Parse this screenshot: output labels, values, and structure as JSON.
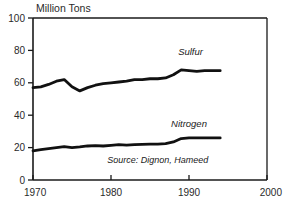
{
  "chart_data": {
    "type": "line",
    "title": "",
    "ylabel": "Million Tons",
    "xlabel": "",
    "xlim": [
      1970,
      2000
    ],
    "ylim": [
      0,
      100
    ],
    "grid": false,
    "legend_position": "inline-right-of-series",
    "x_ticks": [
      "1970",
      "1980",
      "1990",
      "2000"
    ],
    "x_tick_values": [
      1970,
      1980,
      1990,
      2000
    ],
    "y_ticks": [
      "0",
      "20",
      "40",
      "60",
      "80",
      "100"
    ],
    "y_tick_values": [
      0,
      20,
      40,
      60,
      80,
      100
    ],
    "annotations": [
      {
        "text": "Source: Dignon, Hameed",
        "x": 1986.0,
        "y": 10.5
      }
    ],
    "series": [
      {
        "name": "Sulfur",
        "label_x": 1990.2,
        "label_y": 77.0,
        "color": "#111111",
        "x": [
          1970,
          1971,
          1972,
          1973,
          1974,
          1975,
          1976,
          1977,
          1978,
          1979,
          1980,
          1981,
          1982,
          1983,
          1984,
          1985,
          1986,
          1987,
          1988,
          1989,
          1990,
          1991,
          1992,
          1993,
          1994
        ],
        "values": [
          57,
          57.5,
          59,
          61,
          62,
          57.5,
          55,
          57,
          58.5,
          59.5,
          60,
          60.5,
          61,
          62,
          62,
          62.5,
          62.5,
          63,
          65,
          68,
          67.5,
          67,
          67.5,
          67.5,
          67.5
        ]
      },
      {
        "name": "Nitrogen",
        "label_x": 1990.0,
        "label_y": 33.0,
        "color": "#111111",
        "x": [
          1970,
          1971,
          1972,
          1973,
          1974,
          1975,
          1976,
          1977,
          1978,
          1979,
          1980,
          1981,
          1982,
          1983,
          1984,
          1985,
          1986,
          1987,
          1988,
          1989,
          1990,
          1991,
          1992,
          1993,
          1994
        ],
        "values": [
          18,
          18.8,
          19.4,
          20,
          20.6,
          20,
          20.4,
          21,
          21.2,
          21,
          21.4,
          21.8,
          21.5,
          21.8,
          22,
          22.2,
          22.2,
          22.4,
          23.5,
          25.6,
          26,
          26,
          26,
          26,
          26
        ]
      }
    ]
  },
  "axes": {
    "y_axis_title": "Million Tons"
  }
}
